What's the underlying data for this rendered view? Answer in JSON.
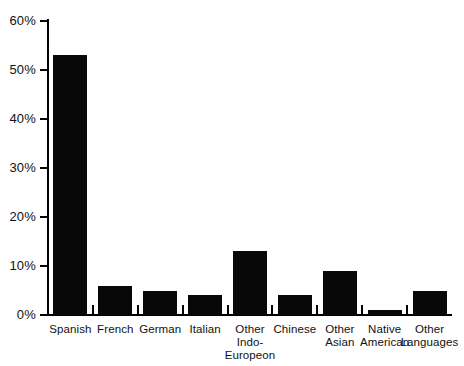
{
  "chart_data": {
    "type": "bar",
    "title": "",
    "subtitle": "",
    "xlabel": "",
    "ylabel": "",
    "ylim": [
      0,
      60
    ],
    "ytick_values": [
      0,
      10,
      20,
      30,
      40,
      50,
      60
    ],
    "ytick_labels": [
      "0%",
      "10%",
      "20%",
      "30%",
      "40%",
      "50%",
      "60%"
    ],
    "grid": false,
    "legend": null,
    "bar_color": "#080808",
    "axis_color": "#000000",
    "categories": [
      "Spanish",
      "French",
      "German",
      "Italian",
      "Other Indo-Europeon",
      "Chinese",
      "Other Asian",
      "Native American",
      "Other Languages"
    ],
    "category_lines": [
      [
        "Spanish"
      ],
      [
        "French"
      ],
      [
        "German"
      ],
      [
        "Italian"
      ],
      [
        "Other",
        "Indo-Europeon"
      ],
      [
        "Chinese"
      ],
      [
        "Other",
        "Asian"
      ],
      [
        "Native",
        "American"
      ],
      [
        "Other",
        "Languages"
      ]
    ],
    "values": [
      53,
      6,
      5,
      4,
      13,
      4,
      9,
      1,
      5
    ],
    "value_unit": "%"
  },
  "axis": {
    "y_labels": [
      "60%",
      "50%",
      "40%",
      "30%",
      "20%",
      "10%",
      "0%"
    ]
  },
  "bars": [
    {
      "label_line1": "Spanish",
      "label_line2": "",
      "value": 53
    },
    {
      "label_line1": "French",
      "label_line2": "",
      "value": 6
    },
    {
      "label_line1": "German",
      "label_line2": "",
      "value": 5
    },
    {
      "label_line1": "Italian",
      "label_line2": "",
      "value": 4
    },
    {
      "label_line1": "Other",
      "label_line2": "Indo-Europeon",
      "value": 13
    },
    {
      "label_line1": "Chinese",
      "label_line2": "",
      "value": 4
    },
    {
      "label_line1": "Other",
      "label_line2": "Asian",
      "value": 9
    },
    {
      "label_line1": "Native",
      "label_line2": "American",
      "value": 1
    },
    {
      "label_line1": "Other",
      "label_line2": "Languages",
      "value": 5
    }
  ]
}
